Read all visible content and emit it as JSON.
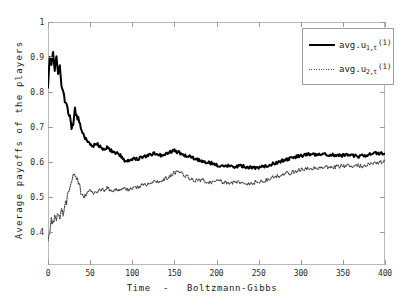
{
  "chart_data": {
    "type": "line",
    "title": "",
    "xlabel": "Time  -   Boltzmann-Gibbs",
    "ylabel": "Average payoffs of the players",
    "xlim": [
      0,
      400
    ],
    "ylim": [
      0.305,
      1.0
    ],
    "grid": false,
    "legend_position": "top-right",
    "xticks": [
      0,
      50,
      100,
      150,
      200,
      250,
      300,
      350,
      400
    ],
    "xtick_labels": [
      "0",
      "50",
      "100",
      "150",
      "200",
      "250",
      "300",
      "350",
      "400"
    ],
    "yticks": [
      0.4,
      0.5,
      0.6,
      0.7,
      0.8,
      0.9,
      1.0
    ],
    "ytick_labels": [
      "0.4",
      "0.5",
      "0.6",
      "0.7",
      "0.8",
      "0.9",
      "1"
    ],
    "series": [
      {
        "name": "avg.u_{1,t}^{(1)}",
        "legend_base": "avg.u",
        "legend_sub": "1,t",
        "legend_sup": "(1)",
        "style": "solid",
        "color": "#000000",
        "width": 2.0,
        "x": [
          0,
          2,
          4,
          6,
          8,
          10,
          12,
          14,
          16,
          18,
          20,
          22,
          24,
          26,
          28,
          30,
          32,
          34,
          36,
          38,
          40,
          42,
          44,
          46,
          48,
          50,
          54,
          58,
          62,
          66,
          70,
          74,
          78,
          82,
          86,
          90,
          94,
          98,
          102,
          106,
          110,
          114,
          118,
          122,
          126,
          130,
          134,
          138,
          142,
          146,
          150,
          154,
          158,
          162,
          166,
          170,
          174,
          178,
          182,
          186,
          190,
          194,
          198,
          202,
          206,
          210,
          214,
          218,
          222,
          226,
          230,
          234,
          238,
          242,
          246,
          250,
          254,
          258,
          262,
          266,
          270,
          274,
          278,
          282,
          286,
          290,
          294,
          298,
          302,
          306,
          310,
          314,
          318,
          322,
          326,
          330,
          334,
          338,
          342,
          346,
          350,
          354,
          358,
          362,
          366,
          370,
          374,
          378,
          382,
          386,
          390,
          394,
          398,
          400
        ],
        "y": [
          0.82,
          0.905,
          0.88,
          0.918,
          0.862,
          0.903,
          0.845,
          0.87,
          0.823,
          0.796,
          0.775,
          0.762,
          0.742,
          0.726,
          0.7,
          0.712,
          0.748,
          0.735,
          0.722,
          0.706,
          0.69,
          0.678,
          0.668,
          0.662,
          0.656,
          0.65,
          0.646,
          0.652,
          0.643,
          0.636,
          0.64,
          0.633,
          0.628,
          0.624,
          0.618,
          0.606,
          0.601,
          0.607,
          0.611,
          0.608,
          0.613,
          0.616,
          0.618,
          0.621,
          0.624,
          0.622,
          0.619,
          0.623,
          0.626,
          0.629,
          0.632,
          0.628,
          0.624,
          0.62,
          0.617,
          0.613,
          0.61,
          0.606,
          0.603,
          0.6,
          0.598,
          0.596,
          0.593,
          0.59,
          0.588,
          0.587,
          0.589,
          0.588,
          0.586,
          0.587,
          0.588,
          0.586,
          0.585,
          0.584,
          0.583,
          0.582,
          0.585,
          0.588,
          0.591,
          0.594,
          0.597,
          0.6,
          0.603,
          0.606,
          0.609,
          0.612,
          0.614,
          0.616,
          0.618,
          0.62,
          0.621,
          0.622,
          0.621,
          0.62,
          0.621,
          0.622,
          0.621,
          0.62,
          0.619,
          0.618,
          0.619,
          0.62,
          0.619,
          0.618,
          0.617,
          0.616,
          0.617,
          0.62,
          0.622,
          0.624,
          0.625,
          0.624,
          0.623,
          0.622
        ]
      },
      {
        "name": "avg.u_{2,t}^{(1)}",
        "legend_base": "avg.u",
        "legend_sub": "2,t",
        "legend_sup": "(1)",
        "style": "dotted",
        "color": "#444444",
        "width": 1.2,
        "x": [
          0,
          2,
          4,
          6,
          8,
          10,
          12,
          14,
          16,
          18,
          20,
          22,
          24,
          26,
          28,
          30,
          32,
          34,
          36,
          38,
          40,
          42,
          44,
          46,
          48,
          50,
          54,
          58,
          62,
          66,
          70,
          74,
          78,
          82,
          86,
          90,
          94,
          98,
          102,
          106,
          110,
          114,
          118,
          122,
          126,
          130,
          134,
          138,
          142,
          146,
          150,
          154,
          158,
          162,
          166,
          170,
          174,
          178,
          182,
          186,
          190,
          194,
          198,
          202,
          206,
          210,
          214,
          218,
          222,
          226,
          230,
          234,
          238,
          242,
          246,
          250,
          254,
          258,
          262,
          266,
          270,
          274,
          278,
          282,
          286,
          290,
          294,
          298,
          302,
          306,
          310,
          314,
          318,
          322,
          326,
          330,
          334,
          338,
          342,
          346,
          350,
          354,
          358,
          362,
          366,
          370,
          374,
          378,
          382,
          386,
          390,
          394,
          398,
          400
        ],
        "y": [
          0.382,
          0.4,
          0.438,
          0.42,
          0.452,
          0.432,
          0.458,
          0.441,
          0.462,
          0.448,
          0.47,
          0.488,
          0.505,
          0.528,
          0.548,
          0.562,
          0.57,
          0.556,
          0.54,
          0.522,
          0.508,
          0.498,
          0.503,
          0.509,
          0.514,
          0.518,
          0.512,
          0.516,
          0.521,
          0.518,
          0.524,
          0.52,
          0.517,
          0.522,
          0.519,
          0.524,
          0.521,
          0.526,
          0.523,
          0.528,
          0.532,
          0.535,
          0.538,
          0.541,
          0.544,
          0.542,
          0.546,
          0.55,
          0.556,
          0.562,
          0.568,
          0.57,
          0.566,
          0.561,
          0.556,
          0.552,
          0.548,
          0.545,
          0.548,
          0.546,
          0.543,
          0.541,
          0.544,
          0.547,
          0.544,
          0.542,
          0.54,
          0.543,
          0.541,
          0.54,
          0.542,
          0.54,
          0.539,
          0.541,
          0.543,
          0.542,
          0.545,
          0.548,
          0.551,
          0.554,
          0.557,
          0.56,
          0.563,
          0.566,
          0.568,
          0.571,
          0.574,
          0.576,
          0.578,
          0.58,
          0.581,
          0.582,
          0.584,
          0.583,
          0.584,
          0.585,
          0.586,
          0.587,
          0.586,
          0.587,
          0.588,
          0.589,
          0.588,
          0.589,
          0.59,
          0.589,
          0.588,
          0.59,
          0.593,
          0.596,
          0.598,
          0.6,
          0.601,
          0.6
        ]
      }
    ]
  }
}
